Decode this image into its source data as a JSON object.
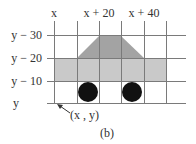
{
  "figure": {
    "caption": "(b)",
    "colors": {
      "grid": "#7a7a7a",
      "body": "#c9c9c9",
      "roof": "#a3a3a3",
      "wheel": "#111111",
      "text": "#333333"
    },
    "x_labels": [
      {
        "text": "x",
        "x": 54
      },
      {
        "text": "x + 20",
        "x": 99
      },
      {
        "text": "x + 40",
        "x": 144
      }
    ],
    "y_labels": [
      {
        "text": "y − 30",
        "y": 35
      },
      {
        "text": "y − 20",
        "y": 58
      },
      {
        "text": "y − 10",
        "y": 81
      },
      {
        "text": "y",
        "y": 103
      }
    ],
    "origin_label": "(x , y)",
    "shapes": {
      "body_rect": {
        "grid_from": [
          "x",
          "y - 20"
        ],
        "grid_to": [
          "x + 50",
          "y - 10"
        ]
      },
      "roof_trapezoid": {
        "top": [
          "x + 20",
          "x + 30"
        ],
        "bottom": [
          "x + 10",
          "x + 40"
        ]
      },
      "wheels": [
        {
          "center": [
            "x + 15",
            "y - 5"
          ],
          "radius": 5
        },
        {
          "center": [
            "x + 35",
            "y - 5"
          ],
          "radius": 5
        }
      ]
    }
  }
}
